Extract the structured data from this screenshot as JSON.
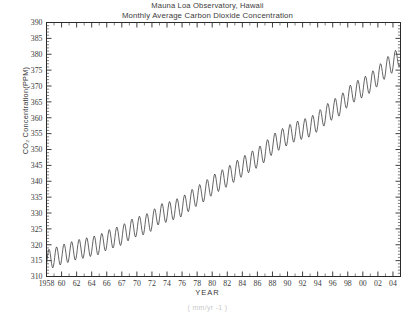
{
  "figure": {
    "title_line1": "Mauna Loa Observatory, Hawaii",
    "title_line2": "Monthly Average Carbon Dioxide Concentration",
    "ylabel": "CO₂ Concentration(PPM)",
    "xlabel": "YEAR",
    "footnote": "( mm/yr -1 )",
    "line_color": "#3c3c3c",
    "axis_color": "#2b2b2b",
    "background": "#ffffff"
  },
  "chart_data": {
    "type": "line",
    "xlabel": "YEAR",
    "ylabel": "CO₂ Concentration(PPM)",
    "xlim": [
      1958,
      2005
    ],
    "ylim": [
      310,
      390
    ],
    "ytick_step": 5,
    "ytick_minor_step": 1,
    "xtick_step": 1,
    "xtick_label_step": 2,
    "grid": false,
    "legend": null,
    "yticks": [
      310,
      315,
      320,
      325,
      330,
      335,
      340,
      345,
      350,
      355,
      360,
      365,
      370,
      375,
      380,
      385,
      390
    ],
    "xtick_labels": [
      "1958",
      "60",
      "62",
      "64",
      "66",
      "67",
      "70",
      "72",
      "74",
      "76",
      "78",
      "80",
      "82",
      "84",
      "86",
      "88",
      "90",
      "92",
      "94",
      "96",
      "98",
      "00",
      "02",
      "04"
    ],
    "xtick_label_years": [
      1958,
      1960,
      1962,
      1964,
      1966,
      1968,
      1970,
      1972,
      1974,
      1976,
      1978,
      1980,
      1982,
      1984,
      1986,
      1988,
      1990,
      1992,
      1994,
      1996,
      1998,
      2000,
      2002,
      2004
    ],
    "series_name": "Monthly mean CO2",
    "seasonal_amplitude_ppm": 6.2,
    "seasonal_peak_month": 5,
    "annual_mean": {
      "years": [
        1958,
        1959,
        1960,
        1961,
        1962,
        1963,
        1964,
        1965,
        1966,
        1967,
        1968,
        1969,
        1970,
        1971,
        1972,
        1973,
        1974,
        1975,
        1976,
        1977,
        1978,
        1979,
        1980,
        1981,
        1982,
        1983,
        1984,
        1985,
        1986,
        1987,
        1988,
        1989,
        1990,
        1991,
        1992,
        1993,
        1994,
        1995,
        1996,
        1997,
        1998,
        1999,
        2000,
        2001,
        2002,
        2003,
        2004,
        2005
      ],
      "values": [
        315.3,
        315.9,
        316.9,
        317.6,
        318.4,
        318.9,
        319.5,
        320.0,
        321.4,
        322.2,
        323.0,
        324.6,
        325.7,
        326.3,
        327.5,
        329.7,
        330.2,
        331.1,
        332.0,
        333.8,
        335.4,
        336.8,
        338.7,
        340.1,
        341.4,
        343.0,
        344.6,
        346.0,
        347.4,
        349.2,
        351.6,
        353.1,
        354.4,
        355.6,
        356.4,
        357.1,
        358.8,
        360.8,
        362.6,
        363.8,
        366.6,
        368.3,
        369.5,
        371.0,
        373.1,
        375.6,
        377.4,
        379.6
      ]
    }
  }
}
